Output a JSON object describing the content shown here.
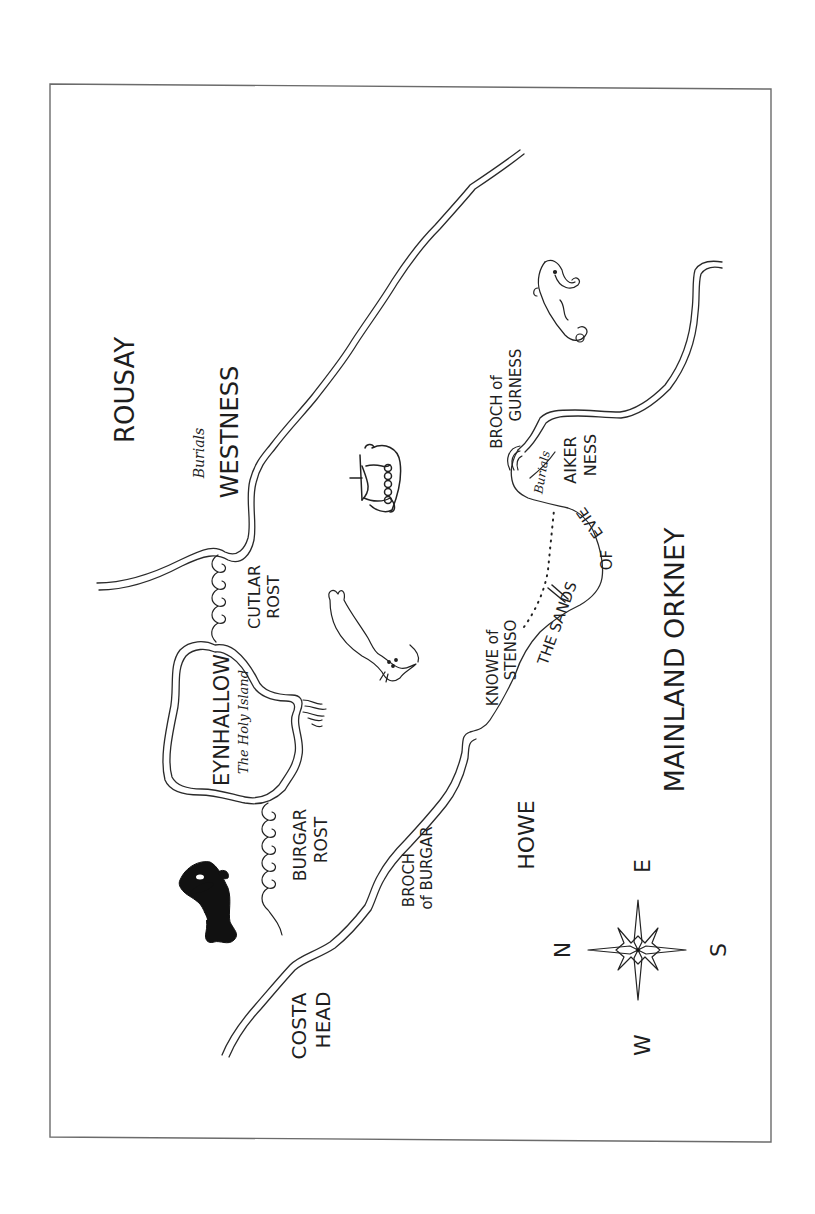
{
  "map": {
    "orientation": "rotated 90 degrees counter-clockwise (north points left)",
    "style": "hand-drawn ink sketch map",
    "frame_color": "#6b6b6b",
    "ink_color": "#222222",
    "background": "#ffffff"
  },
  "labels": {
    "rousay": "ROUSAY",
    "westness_burials": "Burials",
    "westness": "WESTNESS",
    "cutlar_rost_1": "CUTLAR",
    "cutlar_rost_2": "ROST",
    "eynhallow": "EYNHALLOW",
    "eynhallow_subtitle": "The Holy Island",
    "burgar_rost_1": "BURGAR",
    "burgar_rost_2": "ROST",
    "costa_head_1": "COSTA",
    "costa_head_2": "HEAD",
    "broch_of_burgar_1": "BROCH",
    "broch_of_burgar_2": "of BURGAR",
    "howe": "HOWE",
    "knowe_of_stenso_1": "KNOWE of",
    "knowe_of_stenso_2": "STENSO",
    "sands_of_evie_1": "THE SANDS",
    "sands_of_evie_2": "OF",
    "sands_of_evie_3": "EVIE",
    "broch_of_gurness_1": "BROCH of",
    "broch_of_gurness_2": "GURNESS",
    "aikerness_burials": "Burials",
    "aikerness_1": "AIKER",
    "aikerness_2": "NESS",
    "mainland_orkney": "MAINLAND ORKNEY"
  },
  "compass": {
    "north": "N",
    "east": "E",
    "south": "S",
    "west": "W"
  },
  "illustrations": [
    "orca-icon",
    "seal-icon",
    "viking-longship-icon",
    "sea-serpent-icon",
    "compass-rose-icon",
    "wave-swirls-cutlar-rost",
    "wave-swirls-burgar-rost",
    "broch-of-gurness-icon",
    "seaweed-icon"
  ]
}
